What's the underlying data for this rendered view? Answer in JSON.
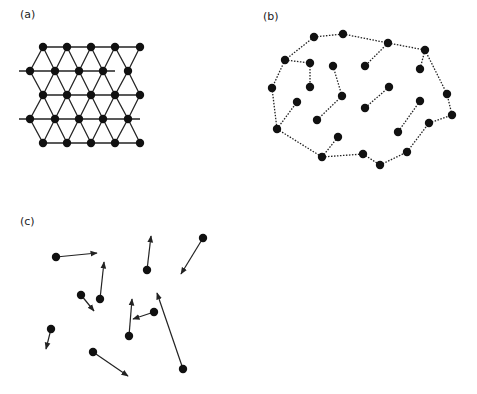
{
  "figure": {
    "panels": [
      {
        "id": "a",
        "label": "(a)",
        "label_pos": [
          20,
          8
        ],
        "description": "ordered triangular lattice"
      },
      {
        "id": "b",
        "label": "(b)",
        "label_pos": [
          263,
          10
        ],
        "description": "polymer-like chain clusters with dotted bonds"
      },
      {
        "id": "c",
        "label": "(c)",
        "label_pos": [
          20,
          215
        ],
        "description": "random particles with velocity arrows"
      }
    ],
    "colors": {
      "node": "#111111",
      "line": "#222222",
      "background": "#ffffff"
    },
    "lattice": {
      "rows": [
        {
          "y": 47,
          "xs": [
            43,
            67,
            91,
            115,
            140
          ],
          "line": [
            43,
            140
          ]
        },
        {
          "y": 71,
          "xs": [
            30,
            55,
            79,
            103,
            128
          ],
          "line": [
            19,
            115
          ]
        },
        {
          "y": 95,
          "xs": [
            43,
            67,
            91,
            115,
            140
          ],
          "line": [
            43,
            140
          ]
        },
        {
          "y": 119,
          "xs": [
            30,
            55,
            79,
            103,
            128
          ],
          "line": [
            19,
            140
          ]
        },
        {
          "y": 143,
          "xs": [
            43,
            67,
            91,
            115,
            140
          ],
          "line": [
            43,
            140
          ]
        }
      ]
    },
    "clusters": {
      "nodes": [
        [
          314,
          37
        ],
        [
          343,
          34
        ],
        [
          388,
          43
        ],
        [
          425,
          50
        ],
        [
          285,
          60
        ],
        [
          310,
          63
        ],
        [
          333,
          66
        ],
        [
          365,
          66
        ],
        [
          420,
          69
        ],
        [
          272,
          88
        ],
        [
          310,
          87
        ],
        [
          342,
          96
        ],
        [
          389,
          87
        ],
        [
          447,
          94
        ],
        [
          297,
          102
        ],
        [
          277,
          129
        ],
        [
          317,
          120
        ],
        [
          365,
          108
        ],
        [
          420,
          101
        ],
        [
          452,
          115
        ],
        [
          429,
          123
        ],
        [
          338,
          137
        ],
        [
          398,
          132
        ],
        [
          322,
          157
        ],
        [
          363,
          154
        ],
        [
          407,
          152
        ],
        [
          380,
          165
        ]
      ],
      "bonds": [
        [
          0,
          1
        ],
        [
          1,
          2
        ],
        [
          2,
          3
        ],
        [
          0,
          4
        ],
        [
          4,
          5
        ],
        [
          5,
          10
        ],
        [
          4,
          9
        ],
        [
          9,
          15
        ],
        [
          15,
          14
        ],
        [
          15,
          23
        ],
        [
          23,
          21
        ],
        [
          23,
          24
        ],
        [
          24,
          26
        ],
        [
          26,
          25
        ],
        [
          25,
          20
        ],
        [
          20,
          19
        ],
        [
          19,
          13
        ],
        [
          13,
          3
        ],
        [
          3,
          8
        ],
        [
          2,
          7
        ],
        [
          6,
          11
        ],
        [
          11,
          16
        ],
        [
          12,
          17
        ],
        [
          18,
          22
        ]
      ]
    },
    "arrows": [
      {
        "from": [
          56,
          257
        ],
        "to": [
          97,
          253
        ]
      },
      {
        "from": [
          100,
          299
        ],
        "to": [
          104,
          262
        ]
      },
      {
        "from": [
          81,
          295
        ],
        "to": [
          94,
          311
        ]
      },
      {
        "from": [
          147,
          270
        ],
        "to": [
          151,
          236
        ]
      },
      {
        "from": [
          203,
          238
        ],
        "to": [
          181,
          274
        ]
      },
      {
        "from": [
          154,
          312
        ],
        "to": [
          133,
          319
        ]
      },
      {
        "from": [
          129,
          336
        ],
        "to": [
          132,
          299
        ]
      },
      {
        "from": [
          51,
          329
        ],
        "to": [
          46,
          349
        ]
      },
      {
        "from": [
          93,
          352
        ],
        "to": [
          128,
          376
        ]
      },
      {
        "from": [
          183,
          369
        ],
        "to": [
          157,
          293
        ]
      }
    ],
    "faint_caption": "",
    "faint_side_mark": ""
  }
}
